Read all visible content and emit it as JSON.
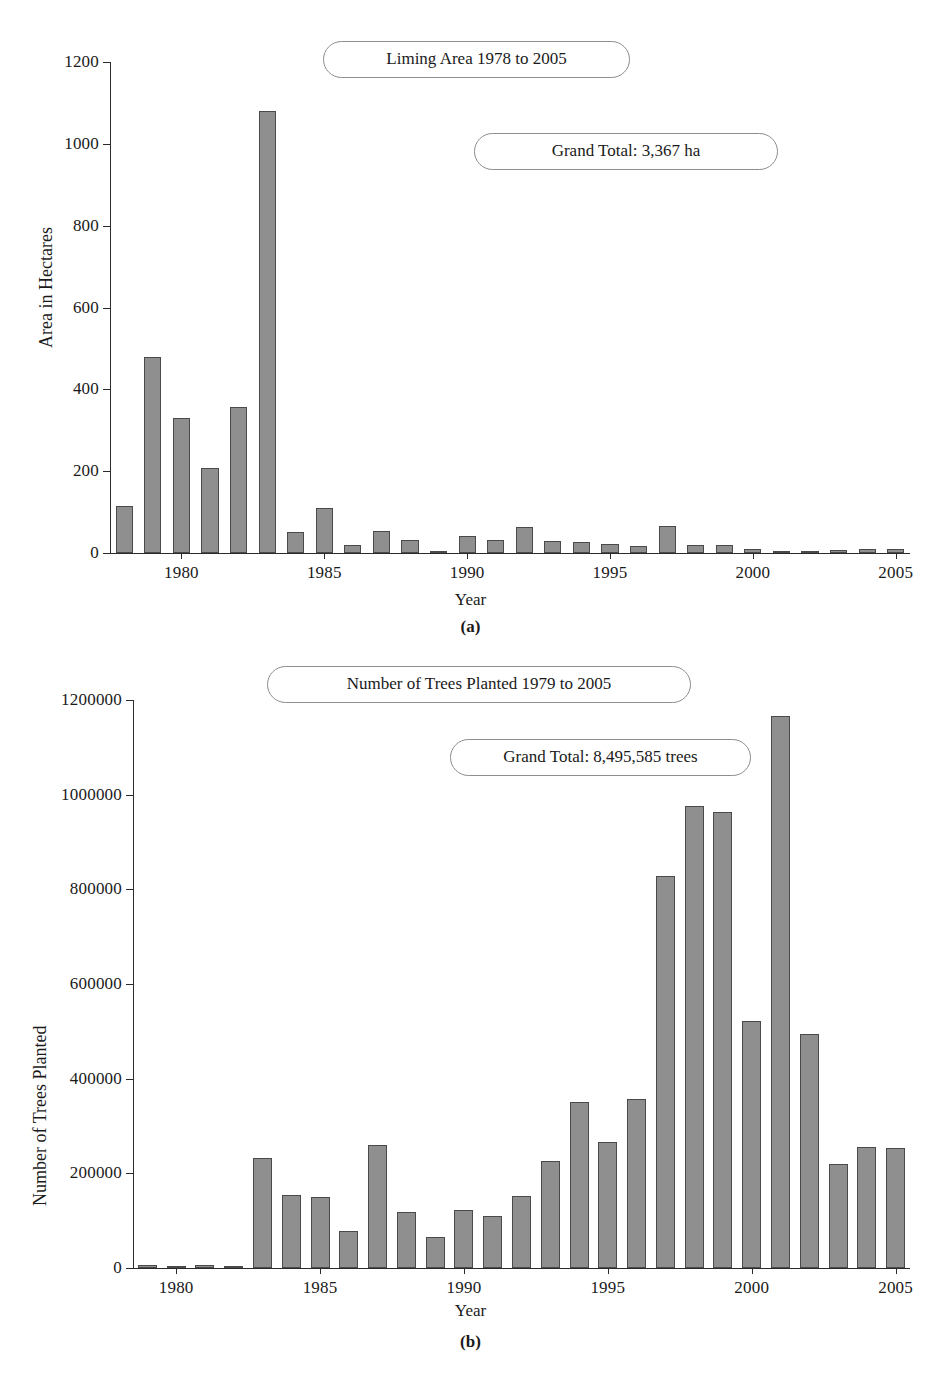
{
  "page": {
    "background": "#ffffff",
    "bar_fill": "#8f8f8f",
    "bar_stroke": "#4a4a4a",
    "axis_color": "#2b2b2b"
  },
  "figure_a": {
    "caption": "(a)",
    "title_box": "Liming Area 1978 to 2005",
    "total_box": "Grand Total: 3,367 ha"
  },
  "figure_b": {
    "caption": "(b)",
    "title_box": "Number of Trees Planted 1979 to 2005",
    "total_box": "Grand Total: 8,495,585 trees"
  },
  "chart_data": [
    {
      "type": "bar",
      "title": "Liming Area 1978 to 2005",
      "annotations": [
        "Liming Area 1978 to 2005",
        "Grand Total: 3,367 ha"
      ],
      "xlabel": "Year",
      "ylabel": "Area in Hectares",
      "ylim": [
        0,
        1200
      ],
      "ytick_labels": [
        "0",
        "200",
        "400",
        "600",
        "800",
        "1000",
        "1200"
      ],
      "yticks": [
        0,
        200,
        400,
        600,
        800,
        1000,
        1200
      ],
      "xtick_labels": [
        "1980",
        "1985",
        "1990",
        "1995",
        "2000",
        "2005"
      ],
      "xticks": [
        1980,
        1985,
        1990,
        1995,
        2000,
        2005
      ],
      "grid": false,
      "legend": null,
      "categories": [
        1978,
        1979,
        1980,
        1981,
        1982,
        1983,
        1984,
        1985,
        1986,
        1987,
        1988,
        1989,
        1990,
        1991,
        1992,
        1993,
        1994,
        1995,
        1996,
        1997,
        1998,
        1999,
        2000,
        2001,
        2002,
        2003,
        2004,
        2005
      ],
      "values": [
        115,
        480,
        330,
        207,
        358,
        1080,
        52,
        110,
        20,
        55,
        33,
        5,
        41,
        33,
        64,
        30,
        26,
        21,
        17,
        65,
        20,
        19,
        9,
        5,
        4,
        7,
        10,
        11
      ],
      "units": "ha",
      "grand_total": "3,367 ha"
    },
    {
      "type": "bar",
      "title": "Number of Trees Planted 1979 to 2005",
      "annotations": [
        "Number of Trees Planted 1979 to 2005",
        "Grand Total: 8,495,585 trees"
      ],
      "xlabel": "Year",
      "ylabel": "Number of Trees Planted",
      "ylim": [
        0,
        1200000
      ],
      "ytick_labels": [
        "0",
        "200000",
        "400000",
        "600000",
        "800000",
        "1000000",
        "1200000"
      ],
      "yticks": [
        0,
        200000,
        400000,
        600000,
        800000,
        1000000,
        1200000
      ],
      "xtick_labels": [
        "1980",
        "1985",
        "1990",
        "1995",
        "2000",
        "2005"
      ],
      "xticks": [
        1980,
        1985,
        1990,
        1995,
        2000,
        2005
      ],
      "grid": false,
      "legend": null,
      "categories": [
        1979,
        1980,
        1981,
        1982,
        1983,
        1984,
        1985,
        1986,
        1987,
        1988,
        1989,
        1990,
        1991,
        1992,
        1993,
        1994,
        1995,
        1996,
        1997,
        1998,
        1999,
        2000,
        2001,
        2002,
        2003,
        2004,
        2005
      ],
      "values": [
        6000,
        1000,
        6000,
        2000,
        233000,
        154000,
        151000,
        79000,
        259000,
        118000,
        66000,
        123000,
        110000,
        153000,
        226000,
        350000,
        266000,
        358000,
        829000,
        977000,
        964000,
        521000,
        1166000,
        495000,
        220000,
        256000,
        253000
      ],
      "units": "trees",
      "grand_total": "8,495,585 trees"
    }
  ]
}
